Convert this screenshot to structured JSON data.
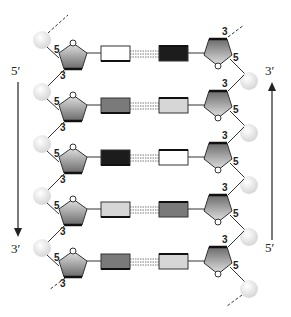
{
  "diagram": {
    "title": "",
    "left_strand": {
      "top_label": "5′",
      "bottom_label": "3′",
      "direction": "down"
    },
    "right_strand": {
      "top_label": "3′",
      "bottom_label": "5′",
      "direction": "up"
    },
    "carbon_labels": {
      "five": "5",
      "three": "3",
      "oxygen": "O"
    },
    "base_pairs": [
      {
        "left": "white",
        "right": "black"
      },
      {
        "left": "dark-gray",
        "right": "light-gray"
      },
      {
        "left": "black",
        "right": "white"
      },
      {
        "left": "light-gray",
        "right": "dark-gray"
      },
      {
        "left": "dark-gray",
        "right": "light-gray"
      }
    ],
    "colors": {
      "white": "#ffffff",
      "black": "#1c1c1c",
      "dark-gray": "#7a7a7a",
      "light-gray": "#d6d6d6",
      "sugar_top": "#e2e2e2",
      "sugar_bottom": "#6a6a6a",
      "phosphate": "#eeeeee",
      "line": "#333333"
    }
  }
}
